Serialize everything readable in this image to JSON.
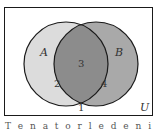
{
  "diagram": {
    "type": "venn",
    "universe_label": "U",
    "sets": [
      {
        "name": "A",
        "region_label": "2",
        "fill": "#dcdcdc"
      },
      {
        "name": "B",
        "region_label": "4",
        "fill": "#a9a9a9"
      }
    ],
    "intersection_label": "3",
    "intersection_fill": "#8c8c8c",
    "outside_label": "1",
    "stroke": "#1a1a1a",
    "caption": "T e n a t o r l e d e n i s"
  }
}
